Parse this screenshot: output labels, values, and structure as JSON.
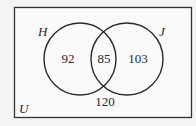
{
  "diagram": {
    "type": "venn",
    "universe_label": "U",
    "sets": [
      {
        "label": "H",
        "only_count": "92"
      },
      {
        "label": "J",
        "only_count": "103"
      }
    ],
    "intersection_count": "85",
    "outside_count": "120"
  },
  "colors": {
    "background": "#f4f4f4",
    "stroke": "#2a2a2a"
  }
}
